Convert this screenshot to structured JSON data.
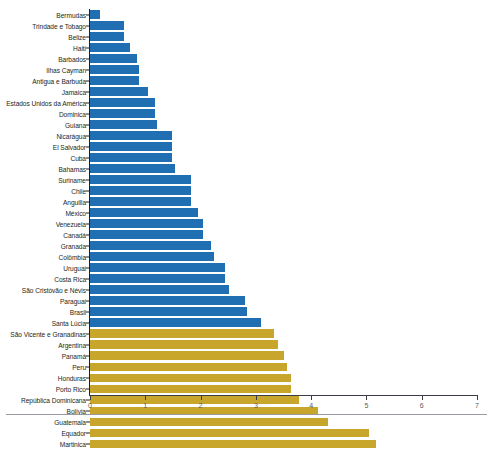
{
  "chart_data": {
    "type": "bar",
    "orientation": "horizontal",
    "title": "",
    "subtitle": "",
    "xlabel": "",
    "ylabel": "",
    "xlim": [
      0,
      7
    ],
    "xticks": [
      0,
      1,
      2,
      3,
      4,
      5,
      6,
      7
    ],
    "xtick_labels": [
      "0",
      "1",
      "2",
      "3",
      "4",
      "5",
      "6",
      "7"
    ],
    "grid": false,
    "legend": "none",
    "colors": {
      "series_blue": "#1f6fb2",
      "series_gold": "#c8a62b",
      "axis": "#231f20",
      "tick_label": "#5c5c63",
      "category_label": "#231f20"
    },
    "categories": [
      "Bermudas",
      "Trindade e Tobago",
      "Belize",
      "Haiti",
      "Barbados",
      "Ilhas Cayman",
      "Antigua e Barbuda",
      "Jamaica",
      "Estados Unidos da América",
      "Dominica",
      "Guiana",
      "Nicarágua",
      "El Salvador",
      "Cuba",
      "Bahamas",
      "Suriname",
      "Chile",
      "Anguilla",
      "México",
      "Venezuela",
      "Canadá",
      "Granada",
      "Colômbia",
      "Uruguai",
      "Costa Rica",
      "São Cristóvão e Névis",
      "Paraguai",
      "Brasil",
      "Santa Lúcia",
      "São Vicente e Granadinas",
      "Argentina",
      "Panamá",
      "Peru",
      "Honduras",
      "Porto Rico",
      "República Dominicana",
      "Bolívia",
      "Guatemala",
      "Equador",
      "Martinica"
    ],
    "values": [
      0.18,
      0.62,
      0.62,
      0.72,
      0.85,
      0.88,
      0.88,
      1.05,
      1.17,
      1.17,
      1.22,
      1.48,
      1.48,
      1.48,
      1.53,
      1.82,
      1.82,
      1.82,
      1.96,
      2.05,
      2.05,
      2.19,
      2.25,
      2.45,
      2.45,
      2.52,
      2.8,
      2.84,
      3.09,
      3.33,
      3.4,
      3.5,
      3.57,
      3.63,
      3.63,
      3.78,
      4.12,
      4.3,
      5.05,
      5.18
    ],
    "groups": [
      "blue",
      "blue",
      "blue",
      "blue",
      "blue",
      "blue",
      "blue",
      "blue",
      "blue",
      "blue",
      "blue",
      "blue",
      "blue",
      "blue",
      "blue",
      "blue",
      "blue",
      "blue",
      "blue",
      "blue",
      "blue",
      "blue",
      "blue",
      "blue",
      "blue",
      "blue",
      "blue",
      "blue",
      "blue",
      "gold",
      "gold",
      "gold",
      "gold",
      "gold",
      "gold",
      "gold",
      "gold",
      "gold",
      "gold",
      "gold"
    ]
  }
}
